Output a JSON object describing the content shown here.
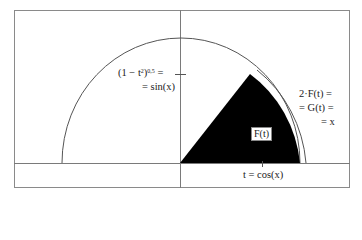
{
  "diagram": {
    "type": "unit-circle-area",
    "labels": {
      "sin_line1": "(1 − t",
      "sin_sup1": "2",
      "sin_mid": ")",
      "sin_sup2": "0,5",
      "sin_eq": " =",
      "sin_line2": "= sin(x)",
      "g_line1": "2·F(t) =",
      "g_line2": "= G(t) =",
      "g_line3": "= x",
      "area_label": "F(t)",
      "t_label": "t = cos(x)"
    },
    "colors": {
      "frame": "#8a8a8a",
      "axis": "#7a7a7a",
      "arc": "#666666",
      "sector_fill": "#000000",
      "background": "#ffffff"
    }
  }
}
